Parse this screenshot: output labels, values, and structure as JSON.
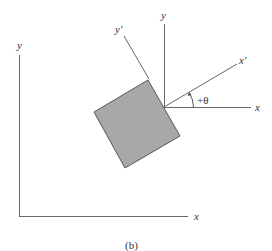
{
  "diagram": {
    "caption": "(b)",
    "fixed_frame": {
      "x_label": "x",
      "y_label": "y"
    },
    "local_frame": {
      "x_label": "x",
      "y_label": "y"
    },
    "rotated_frame": {
      "x_label": "x′",
      "y_label": "y′"
    },
    "angle_label": "+θ",
    "colors": {
      "square_fill": "#a8a8a8",
      "line": "#555555"
    }
  }
}
